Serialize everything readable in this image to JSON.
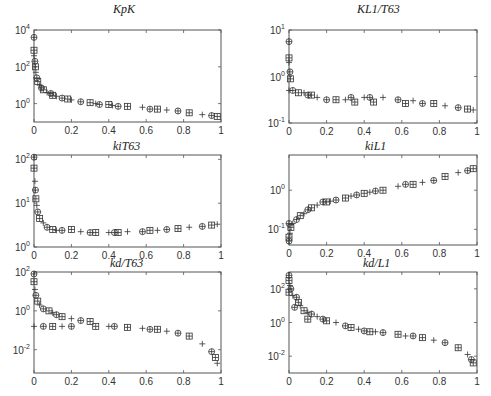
{
  "figure": {
    "layout": "3x2 grid of log-scale scatter subplots",
    "marker_legend": [
      "circle-plus (⊕)",
      "square-plus (⊞)",
      "plus (+)"
    ]
  },
  "chart_data": [
    {
      "id": "kpK",
      "type": "scatter",
      "title": "K_p K",
      "title_display": "KpK",
      "xlim": [
        0,
        1
      ],
      "yscale": "log",
      "ylim_exp": [
        -1,
        4
      ],
      "xticks": [
        "0",
        "0.2",
        "0.4",
        "0.6",
        "0.8",
        "1"
      ],
      "yticks": [
        {
          "exp": 0,
          "label": "10^0"
        },
        {
          "exp": 2,
          "label": "10^2"
        },
        {
          "exp": 4,
          "label": "10^4"
        }
      ],
      "grid": false,
      "points": [
        [
          0.0,
          3.6
        ],
        [
          0.0,
          2.9
        ],
        [
          0.0,
          2.6
        ],
        [
          0.005,
          2.3
        ],
        [
          0.008,
          2.0
        ],
        [
          0.01,
          1.7
        ],
        [
          0.015,
          1.4
        ],
        [
          0.02,
          1.2
        ],
        [
          0.03,
          1.0
        ],
        [
          0.04,
          0.85
        ],
        [
          0.05,
          0.75
        ],
        [
          0.07,
          0.6
        ],
        [
          0.09,
          0.55
        ],
        [
          0.1,
          0.45
        ],
        [
          0.12,
          0.4
        ],
        [
          0.15,
          0.3
        ],
        [
          0.18,
          0.25
        ],
        [
          0.2,
          0.2
        ],
        [
          0.25,
          0.1
        ],
        [
          0.3,
          0.05
        ],
        [
          0.33,
          0.0
        ],
        [
          0.35,
          -0.05
        ],
        [
          0.4,
          -0.05
        ],
        [
          0.42,
          -0.1
        ],
        [
          0.45,
          -0.15
        ],
        [
          0.5,
          -0.15
        ],
        [
          0.58,
          -0.2
        ],
        [
          0.62,
          -0.3
        ],
        [
          0.66,
          -0.3
        ],
        [
          0.71,
          -0.35
        ],
        [
          0.77,
          -0.4
        ],
        [
          0.83,
          -0.5
        ],
        [
          0.9,
          -0.6
        ],
        [
          0.95,
          -0.65
        ],
        [
          0.98,
          -0.7
        ]
      ]
    },
    {
      "id": "KL1T63",
      "type": "scatter",
      "title": "K L_1 / T_63",
      "title_display": "KL1/T63",
      "xlim": [
        0,
        1
      ],
      "yscale": "log",
      "ylim_exp": [
        -1,
        1
      ],
      "xticks": [
        "0",
        "0.2",
        "0.4",
        "0.6",
        "0.8",
        "1"
      ],
      "yticks": [
        {
          "exp": -1,
          "label": "10^-1"
        },
        {
          "exp": 0,
          "label": "10^0"
        },
        {
          "exp": 1,
          "label": "10^1"
        }
      ],
      "grid": false,
      "points": [
        [
          0.0,
          0.75
        ],
        [
          0.0,
          0.4
        ],
        [
          0.0,
          0.3
        ],
        [
          0.005,
          0.1
        ],
        [
          0.008,
          -0.05
        ],
        [
          0.0,
          -0.3
        ],
        [
          0.02,
          -0.3
        ],
        [
          0.05,
          -0.35
        ],
        [
          0.08,
          -0.35
        ],
        [
          0.1,
          -0.4
        ],
        [
          0.12,
          -0.4
        ],
        [
          0.15,
          -0.45
        ],
        [
          0.2,
          -0.5
        ],
        [
          0.25,
          -0.5
        ],
        [
          0.3,
          -0.5
        ],
        [
          0.33,
          -0.45
        ],
        [
          0.35,
          -0.55
        ],
        [
          0.4,
          -0.45
        ],
        [
          0.43,
          -0.45
        ],
        [
          0.45,
          -0.55
        ],
        [
          0.5,
          -0.45
        ],
        [
          0.58,
          -0.5
        ],
        [
          0.62,
          -0.58
        ],
        [
          0.66,
          -0.52
        ],
        [
          0.71,
          -0.58
        ],
        [
          0.77,
          -0.58
        ],
        [
          0.83,
          -0.63
        ],
        [
          0.9,
          -0.67
        ],
        [
          0.95,
          -0.7
        ],
        [
          0.98,
          -0.72
        ]
      ]
    },
    {
      "id": "kiT63",
      "type": "scatter",
      "title": "k_i T_63",
      "title_display": "kiT63",
      "xlim": [
        0,
        1
      ],
      "yscale": "log",
      "ylim_exp": [
        0,
        2.1
      ],
      "xticks": [
        "0",
        "0.2",
        "0.4",
        "0.6",
        "0.8",
        "1"
      ],
      "yticks": [
        {
          "exp": 0,
          "label": "10^0"
        },
        {
          "exp": 1,
          "label": "10^1"
        },
        {
          "exp": 2,
          "label": "10^2"
        }
      ],
      "grid": false,
      "points": [
        [
          0.0,
          2.05
        ],
        [
          0.0,
          1.8
        ],
        [
          0.005,
          1.5
        ],
        [
          0.008,
          1.3
        ],
        [
          0.01,
          1.1
        ],
        [
          0.015,
          0.95
        ],
        [
          0.02,
          0.8
        ],
        [
          0.03,
          0.65
        ],
        [
          0.05,
          0.55
        ],
        [
          0.07,
          0.45
        ],
        [
          0.1,
          0.4
        ],
        [
          0.12,
          0.38
        ],
        [
          0.15,
          0.38
        ],
        [
          0.2,
          0.4
        ],
        [
          0.25,
          0.35
        ],
        [
          0.3,
          0.33
        ],
        [
          0.33,
          0.33
        ],
        [
          0.4,
          0.33
        ],
        [
          0.43,
          0.33
        ],
        [
          0.45,
          0.33
        ],
        [
          0.5,
          0.35
        ],
        [
          0.58,
          0.35
        ],
        [
          0.62,
          0.38
        ],
        [
          0.66,
          0.38
        ],
        [
          0.71,
          0.4
        ],
        [
          0.77,
          0.42
        ],
        [
          0.83,
          0.45
        ],
        [
          0.9,
          0.47
        ],
        [
          0.95,
          0.5
        ],
        [
          0.98,
          0.52
        ]
      ]
    },
    {
      "id": "kiL1",
      "type": "scatter",
      "title": "k_i L_1",
      "title_display": "kiL1",
      "xlim": [
        0,
        1
      ],
      "yscale": "log",
      "ylim_exp": [
        -1.4,
        0.9
      ],
      "xticks": [
        "0",
        "0.2",
        "0.4",
        "0.6",
        "0.8",
        "1"
      ],
      "yticks": [
        {
          "exp": -1,
          "label": "10^-1"
        },
        {
          "exp": 0,
          "label": "10^0"
        }
      ],
      "grid": false,
      "points": [
        [
          0.0,
          -1.3
        ],
        [
          0.0,
          -1.2
        ],
        [
          0.005,
          -1.1
        ],
        [
          0.0,
          -0.85
        ],
        [
          0.01,
          -0.95
        ],
        [
          0.02,
          -0.85
        ],
        [
          0.04,
          -0.75
        ],
        [
          0.06,
          -0.65
        ],
        [
          0.08,
          -0.6
        ],
        [
          0.1,
          -0.5
        ],
        [
          0.12,
          -0.45
        ],
        [
          0.15,
          -0.38
        ],
        [
          0.18,
          -0.3
        ],
        [
          0.2,
          -0.3
        ],
        [
          0.22,
          -0.28
        ],
        [
          0.25,
          -0.25
        ],
        [
          0.3,
          -0.2
        ],
        [
          0.33,
          -0.15
        ],
        [
          0.36,
          -0.12
        ],
        [
          0.4,
          -0.08
        ],
        [
          0.43,
          -0.05
        ],
        [
          0.46,
          -0.02
        ],
        [
          0.5,
          0.0
        ],
        [
          0.58,
          0.1
        ],
        [
          0.62,
          0.15
        ],
        [
          0.66,
          0.15
        ],
        [
          0.71,
          0.2
        ],
        [
          0.77,
          0.25
        ],
        [
          0.83,
          0.35
        ],
        [
          0.9,
          0.45
        ],
        [
          0.95,
          0.5
        ],
        [
          0.98,
          0.55
        ]
      ]
    },
    {
      "id": "kdT63",
      "type": "scatter",
      "title": "k_d / T_63",
      "title_display": "kd/T63",
      "xlim": [
        0,
        1
      ],
      "yscale": "log",
      "ylim_exp": [
        -3.2,
        2
      ],
      "xticks": [
        "0",
        "0.2",
        "0.4",
        "0.6",
        "0.8",
        "1"
      ],
      "yticks": [
        {
          "exp": -2,
          "label": "10^-2"
        },
        {
          "exp": 0,
          "label": "10^0"
        },
        {
          "exp": 2,
          "label": "10^2"
        }
      ],
      "grid": false,
      "points": [
        [
          0.0,
          1.9
        ],
        [
          0.0,
          1.5
        ],
        [
          0.005,
          1.1
        ],
        [
          0.01,
          0.8
        ],
        [
          0.02,
          0.5
        ],
        [
          0.03,
          0.3
        ],
        [
          0.05,
          0.1
        ],
        [
          0.08,
          0.0
        ],
        [
          0.1,
          -0.1
        ],
        [
          0.12,
          -0.2
        ],
        [
          0.15,
          -0.3
        ],
        [
          0.2,
          -0.4
        ],
        [
          0.25,
          -0.5
        ],
        [
          0.3,
          -0.55
        ],
        [
          0.0,
          -0.8
        ],
        [
          0.05,
          -0.8
        ],
        [
          0.1,
          -0.8
        ],
        [
          0.15,
          -0.8
        ],
        [
          0.2,
          -0.8
        ],
        [
          0.33,
          -0.8
        ],
        [
          0.4,
          -0.8
        ],
        [
          0.43,
          -0.8
        ],
        [
          0.5,
          -0.85
        ],
        [
          0.58,
          -0.9
        ],
        [
          0.62,
          -0.95
        ],
        [
          0.66,
          -0.95
        ],
        [
          0.71,
          -1.05
        ],
        [
          0.77,
          -1.15
        ],
        [
          0.83,
          -1.3
        ],
        [
          0.9,
          -1.7
        ],
        [
          0.95,
          -2.1
        ],
        [
          0.97,
          -2.4
        ],
        [
          0.98,
          -2.7
        ]
      ]
    },
    {
      "id": "kdL1",
      "type": "scatter",
      "title": "k_d / L_1",
      "title_display": "kd/L1",
      "xlim": [
        0,
        1
      ],
      "yscale": "log",
      "ylim_exp": [
        -3,
        3
      ],
      "xticks": [
        "0",
        "0.2",
        "0.4",
        "0.6",
        "0.8",
        "1"
      ],
      "yticks": [
        {
          "exp": -2,
          "label": "10^-2"
        },
        {
          "exp": 0,
          "label": "10^0"
        },
        {
          "exp": 2,
          "label": "10^2"
        }
      ],
      "grid": false,
      "points": [
        [
          0.0,
          2.8
        ],
        [
          0.0,
          2.5
        ],
        [
          0.005,
          2.2
        ],
        [
          0.01,
          2.0
        ],
        [
          0.0,
          1.8
        ],
        [
          0.02,
          1.6
        ],
        [
          0.04,
          1.5
        ],
        [
          0.05,
          1.2
        ],
        [
          0.06,
          1.0
        ],
        [
          0.03,
          0.9
        ],
        [
          0.08,
          0.7
        ],
        [
          0.1,
          0.6
        ],
        [
          0.12,
          0.5
        ],
        [
          0.1,
          0.2
        ],
        [
          0.15,
          0.35
        ],
        [
          0.18,
          0.2
        ],
        [
          0.2,
          0.1
        ],
        [
          0.25,
          0.0
        ],
        [
          0.3,
          -0.2
        ],
        [
          0.33,
          -0.3
        ],
        [
          0.37,
          -0.4
        ],
        [
          0.4,
          -0.5
        ],
        [
          0.43,
          -0.55
        ],
        [
          0.46,
          -0.55
        ],
        [
          0.5,
          -0.6
        ],
        [
          0.58,
          -0.7
        ],
        [
          0.62,
          -0.8
        ],
        [
          0.66,
          -0.8
        ],
        [
          0.71,
          -0.9
        ],
        [
          0.77,
          -1.05
        ],
        [
          0.83,
          -1.2
        ],
        [
          0.9,
          -1.5
        ],
        [
          0.95,
          -1.9
        ],
        [
          0.97,
          -2.2
        ],
        [
          0.98,
          -2.4
        ]
      ]
    }
  ]
}
